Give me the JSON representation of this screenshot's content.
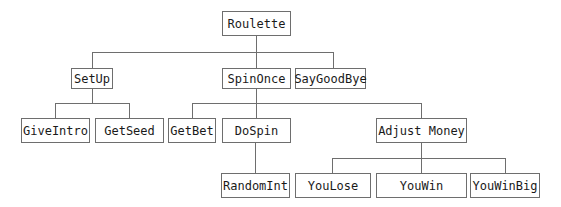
{
  "diagram": {
    "type": "tree",
    "nodes": {
      "roulette": "Roulette",
      "setup": "SetUp",
      "spinonce": "SpinOnce",
      "saygoodbye": "SayGoodBye",
      "giveintro": "GiveIntro",
      "getseed": "GetSeed",
      "getbet": "GetBet",
      "dospin": "DoSpin",
      "adjustmoney": "Adjust Money",
      "randomint": "RandomInt",
      "youlose": "YouLose",
      "youwin": "YouWin",
      "youwinbig": "YouWinBig"
    },
    "edges": [
      [
        "Roulette",
        "SetUp"
      ],
      [
        "Roulette",
        "SpinOnce"
      ],
      [
        "Roulette",
        "SayGoodBye"
      ],
      [
        "SetUp",
        "GiveIntro"
      ],
      [
        "SetUp",
        "GetSeed"
      ],
      [
        "SpinOnce",
        "GetBet"
      ],
      [
        "SpinOnce",
        "DoSpin"
      ],
      [
        "SpinOnce",
        "Adjust Money"
      ],
      [
        "DoSpin",
        "RandomInt"
      ],
      [
        "Adjust Money",
        "YouLose"
      ],
      [
        "Adjust Money",
        "YouWin"
      ],
      [
        "Adjust Money",
        "YouWinBig"
      ]
    ]
  }
}
